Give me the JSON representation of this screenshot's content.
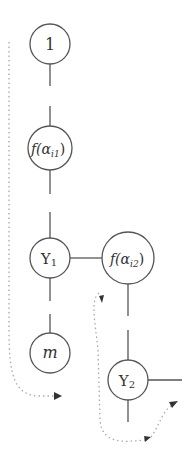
{
  "colors": {
    "stroke": "#555555",
    "dotted": "#aaaaaa",
    "text": "#333333",
    "background": "#ffffff"
  },
  "nodes": [
    {
      "id": "n1",
      "label": "1",
      "cx": 50,
      "cy": 44,
      "r": 20
    },
    {
      "id": "f_ai1",
      "label_prefix": "f(α",
      "label_sub": "i1",
      "label_suffix": ")",
      "cx": 50,
      "cy": 148,
      "r": 22
    },
    {
      "id": "y1",
      "label_main": "Y",
      "label_sub": "1",
      "cx": 50,
      "cy": 258,
      "r": 20
    },
    {
      "id": "m",
      "label": "m",
      "cx": 50,
      "cy": 353,
      "r": 20
    },
    {
      "id": "f_ai2",
      "label_prefix": "f(α",
      "label_sub": "i2",
      "label_suffix": ")",
      "cx": 128,
      "cy": 258,
      "r": 26
    },
    {
      "id": "y2",
      "label_main": "Y",
      "label_sub": "2",
      "cx": 128,
      "cy": 380,
      "r": 20
    }
  ],
  "labels": {
    "n1": "1",
    "f_ai1_prefix": "f(α",
    "f_ai1_sub": "i1",
    "f_ai1_suffix": ")",
    "y1_main": "Y",
    "y1_sub": "1",
    "m": "m",
    "f_ai2_prefix": "f(α",
    "f_ai2_sub": "i2",
    "f_ai2_suffix": ")",
    "y2_main": "Y",
    "y2_sub": "2"
  },
  "edges": [
    {
      "from": "n1",
      "to": "f_ai1",
      "style": "broken-vertical"
    },
    {
      "from": "f_ai1",
      "to": "y1",
      "style": "broken-vertical"
    },
    {
      "from": "y1",
      "to": "m",
      "style": "broken-vertical"
    },
    {
      "from": "y1",
      "to": "f_ai2",
      "style": "solid-horizontal"
    },
    {
      "from": "f_ai2",
      "to": "y2",
      "style": "broken-vertical"
    },
    {
      "from": "y2",
      "to": "right-stub",
      "style": "solid-horizontal"
    },
    {
      "from": "y2",
      "to": "bottom-stub",
      "style": "solid-vertical"
    }
  ],
  "paths": [
    {
      "id": "traversal-1",
      "style": "dotted",
      "description": "from top-left, down and around below m, arrow pointing right"
    },
    {
      "id": "traversal-2",
      "style": "dotted",
      "description": "from arrow near f(αi2) down and around below Y2, arrows pointing up-right"
    }
  ]
}
